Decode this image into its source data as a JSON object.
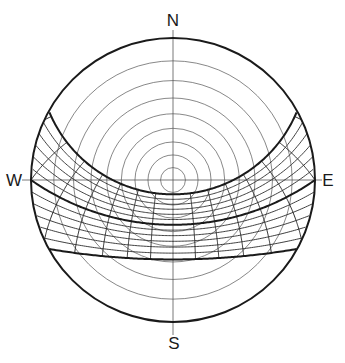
{
  "diagram": {
    "type": "stereographic-sun-path",
    "compass": {
      "north": {
        "label": "N",
        "x": 173,
        "y": 20
      },
      "south": {
        "label": "S",
        "x": 174,
        "y": 343
      },
      "west": {
        "label": "W",
        "x": 14,
        "y": 180
      },
      "east": {
        "label": "E",
        "x": 328,
        "y": 180
      }
    },
    "geometry": {
      "center_x": 173,
      "center_y": 180,
      "radius": 142,
      "axis_extent_top": 30,
      "axis_extent_bottom": 335,
      "axis_extent_left": 22,
      "axis_extent_right": 322
    },
    "colors": {
      "horizon": "#1a1a1a",
      "altitude_rings": "#555555",
      "axes": "#555555",
      "solstice_equinox": "#1a1a1a",
      "date_lines": "#2a2a2a",
      "hour_lines": "#2a2a2a"
    }
  },
  "chart_data": {
    "type": "sun-path",
    "projection": "stereographic",
    "latitude_deg": 35,
    "orientation": {
      "top": "N",
      "bottom": "S",
      "left": "W",
      "right": "E"
    },
    "altitude_rings_deg": [
      80,
      70,
      60,
      50,
      40,
      30,
      20,
      10
    ],
    "declination_lines_deg": [
      23.45,
      19.5,
      15.6,
      11.7,
      7.8,
      3.9,
      0,
      -3.9,
      -7.8,
      -11.7,
      -15.6,
      -19.5,
      -23.45
    ],
    "bold_declinations_deg": [
      23.45,
      0,
      -23.45
    ],
    "bold_labels": [
      "Summer solstice",
      "Equinox",
      "Winter solstice"
    ],
    "hour_lines": [
      4,
      5,
      6,
      7,
      8,
      9,
      10,
      11,
      13,
      14,
      15,
      16,
      17,
      18,
      19,
      20
    ],
    "grid": true,
    "legend": null,
    "title": ""
  }
}
